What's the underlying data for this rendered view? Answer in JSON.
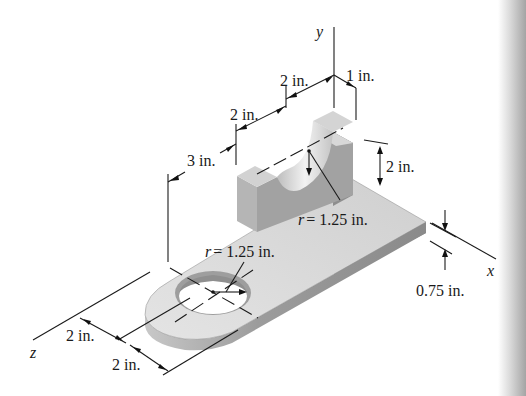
{
  "figure": {
    "type": "isometric machine part with dimensions",
    "axes": {
      "x": "x",
      "y": "y",
      "z": "z"
    },
    "dimensions": {
      "top_width_right": "1 in.",
      "top_width_left": "2 in.",
      "upper_left": "2 in.",
      "offset_left": "3 in.",
      "upright_height": "2 in.",
      "slot_radius": "r = 1.25 in.",
      "hole_radius": "r = 1.25 in.",
      "plate_thickness": "0.75 in.",
      "bottom_left_1": "2 in.",
      "bottom_left_2": "2 in."
    },
    "colors": {
      "top_face": "#d6d6d6",
      "front_face": "#9a9a9a",
      "side_face": "#b8b8b8",
      "binding_shadow": "#a8a8a8"
    }
  }
}
